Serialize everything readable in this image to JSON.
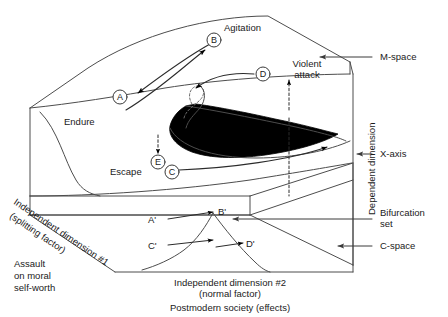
{
  "figure": {
    "title_hidden": "",
    "type": "cusp-catastrophe-3d-diagram",
    "colors": {
      "line": "#4d4d4d",
      "fold_fill": "#000000",
      "text": "#1a1a1a",
      "background": "#ffffff"
    }
  },
  "surface_labels": {
    "agitation": "Agitation",
    "violent_attack_line1": "Violent",
    "violent_attack_line2": "attack",
    "endure": "Endure",
    "escape": "Escape"
  },
  "path_markers": {
    "a": "A",
    "b": "B",
    "c": "C",
    "d": "D",
    "e": "E"
  },
  "projected_markers": {
    "a_prime": "A'",
    "b_prime": "B'",
    "c_prime": "C'",
    "d_prime": "D'"
  },
  "right_annotations": {
    "m_space": "M-space",
    "x_axis": "X-axis",
    "bifurcation_set_line1": "Bifurcation",
    "bifurcation_set_line2": "set",
    "c_space": "C-space",
    "dependent_dimension": "Dependent dimension"
  },
  "axis_labels": {
    "independent_1_line1": "Independent dimension #1",
    "independent_1_line2": "(splitting factor)",
    "independent_2_line1": "Independent dimension #2",
    "independent_2_line2": "(normal factor)",
    "bottom_caption": "Postmodern society (effects)"
  },
  "left_caption": {
    "line1": "Assault",
    "line2": "on moral",
    "line3": "self-worth"
  }
}
